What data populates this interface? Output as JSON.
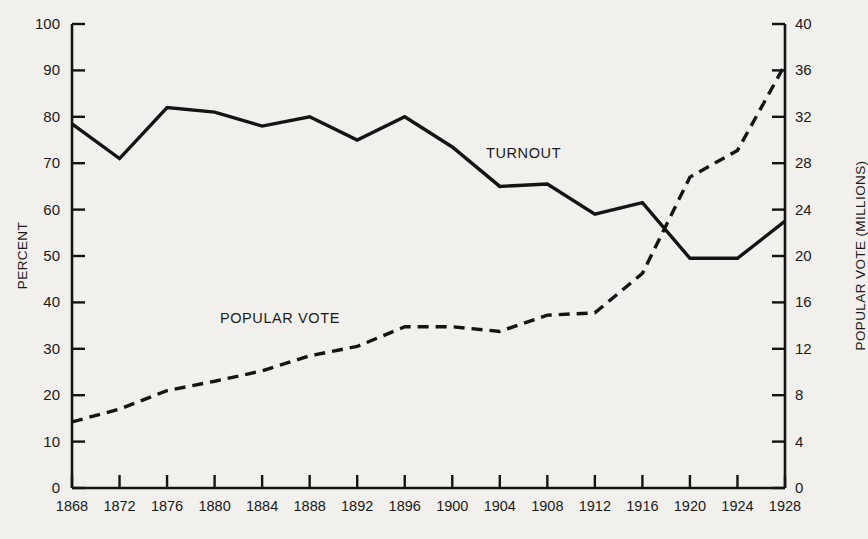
{
  "chart_data": {
    "type": "line",
    "title": "",
    "xlabel": "",
    "ylabel": "PERCENT",
    "y2label": "POPULAR VOTE (MILLIONS)",
    "grid": false,
    "legend_position": "inline-annotations",
    "x": [
      1868,
      1872,
      1876,
      1880,
      1884,
      1888,
      1892,
      1896,
      1900,
      1904,
      1908,
      1912,
      1916,
      1920,
      1924,
      1928
    ],
    "xtick_labels": [
      "1868",
      "1872",
      "1876",
      "1880",
      "1884",
      "1888",
      "1892",
      "1896",
      "1900",
      "1904",
      "1908",
      "1912",
      "1916",
      "1920",
      "1924",
      "1928"
    ],
    "ylim": [
      0,
      100
    ],
    "ytick_labels": [
      "0",
      "10",
      "20",
      "30",
      "40",
      "50",
      "60",
      "70",
      "80",
      "90",
      "100"
    ],
    "ytick_values": [
      0,
      10,
      20,
      30,
      40,
      50,
      60,
      70,
      80,
      90,
      100
    ],
    "y2lim": [
      0,
      40
    ],
    "y2tick_labels": [
      "0",
      "4",
      "8",
      "12",
      "16",
      "20",
      "24",
      "28",
      "32",
      "36",
      "40"
    ],
    "y2tick_values": [
      0,
      4,
      8,
      12,
      16,
      20,
      24,
      28,
      32,
      36,
      40
    ],
    "series": [
      {
        "name": "TURNOUT",
        "axis": "left",
        "style": "solid",
        "color": "#141414",
        "unit": "percent",
        "values": [
          78.5,
          71.0,
          82.0,
          81.0,
          78.0,
          80.0,
          75.0,
          80.0,
          73.5,
          65.0,
          65.5,
          59.0,
          61.5,
          49.5,
          49.5,
          57.5
        ]
      },
      {
        "name": "POPULAR VOTE",
        "axis": "right",
        "style": "dashed",
        "color": "#141414",
        "unit": "millions",
        "values": [
          5.7,
          6.8,
          8.4,
          9.2,
          10.1,
          11.4,
          12.2,
          13.9,
          13.9,
          13.5,
          14.9,
          15.1,
          18.5,
          26.8,
          29.1,
          36.5
        ]
      }
    ],
    "annotations": [
      {
        "text": "TURNOUT",
        "x": 1906,
        "y": 72
      },
      {
        "text": "POPULAR VOTE",
        "x": 1885.5,
        "y": 36.5
      }
    ]
  },
  "labels": {
    "y_axis_title": "PERCENT",
    "y2_axis_title": "POPULAR VOTE (MILLIONS)",
    "turnout_annotation": "TURNOUT",
    "popular_vote_annotation": "POPULAR VOTE"
  }
}
